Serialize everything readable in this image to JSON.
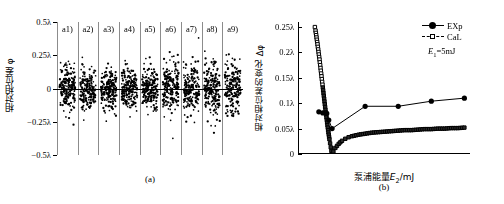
{
  "figure": {
    "panel_a_caption": "(a)",
    "panel_b_caption": "(b)"
  },
  "panel_a": {
    "ylabel": "相对相位差 φ",
    "yticks": [
      "0.5λ",
      "0.25λ",
      "0",
      "−0.25λ",
      "−0.5λ"
    ],
    "column_labels": [
      "a1)",
      "a2)",
      "a3)",
      "a4)",
      "a5)",
      "a6)",
      "a7)",
      "a8)",
      "a9)"
    ]
  },
  "panel_b": {
    "ylabel": "相对相位差的变化 Δφ",
    "xlabel": "泵浦能量E₂/mJ",
    "yticks": [
      "0.25λ",
      "0.2λ",
      "0.15λ",
      "0.1λ",
      "0.05λ",
      "0"
    ],
    "xticks": [
      "0",
      "5",
      "10",
      "15",
      "20",
      "25"
    ],
    "legend": [
      {
        "label": "EXp",
        "marker": "filled-circle",
        "line": "solid"
      },
      {
        "label": "CaL",
        "marker": "open-square",
        "line": "dashed"
      }
    ],
    "annotation": "E₁=5mJ"
  },
  "colors": {
    "ink": "#000000",
    "grid": "#9a9a9a",
    "background": "#ffffff"
  },
  "chart_data": [
    {
      "type": "scatter",
      "panel": "(a)",
      "title": "",
      "xlabel": "",
      "ylabel": "相对相位差 φ",
      "ylim": [
        -0.5,
        0.5
      ],
      "ytick_values": [
        0.5,
        0.25,
        0,
        -0.25,
        -0.5
      ],
      "ytick_labels": [
        "0.5λ",
        "0.25λ",
        "0",
        "−0.25λ",
        "−0.5λ"
      ],
      "grid": false,
      "units": "lambda",
      "groups": [
        {
          "name": "a1)",
          "n": 180,
          "center": 0.0,
          "spread": 0.085,
          "seed": 11
        },
        {
          "name": "a2)",
          "n": 180,
          "center": -0.005,
          "spread": 0.08,
          "seed": 23
        },
        {
          "name": "a3)",
          "n": 180,
          "center": -0.005,
          "spread": 0.082,
          "seed": 37
        },
        {
          "name": "a4)",
          "n": 180,
          "center": 0.0,
          "spread": 0.07,
          "seed": 41
        },
        {
          "name": "a5)",
          "n": 180,
          "center": -0.005,
          "spread": 0.072,
          "seed": 59
        },
        {
          "name": "a6)",
          "n": 180,
          "center": 0.0,
          "spread": 0.098,
          "seed": 67
        },
        {
          "name": "a7)",
          "n": 180,
          "center": 0.0,
          "spread": 0.092,
          "seed": 73
        },
        {
          "name": "a8)",
          "n": 180,
          "center": -0.005,
          "spread": 0.105,
          "seed": 89
        },
        {
          "name": "a9)",
          "n": 180,
          "center": 0.0,
          "spread": 0.1,
          "seed": 97
        }
      ]
    },
    {
      "type": "line",
      "panel": "(b)",
      "title": "",
      "xlabel": "泵浦能量E₂/mJ",
      "ylabel": "相对相位差的变化 Δφ",
      "xlim": [
        0,
        26
      ],
      "ylim": [
        0,
        0.26
      ],
      "xtick_values": [
        0,
        5,
        10,
        15,
        20,
        25
      ],
      "ytick_values": [
        0,
        0.05,
        0.1,
        0.15,
        0.2,
        0.25
      ],
      "ytick_labels": [
        "0",
        "0.05λ",
        "0.1λ",
        "0.15λ",
        "0.2λ",
        "0.25λ"
      ],
      "grid": false,
      "legend_position": "top-right",
      "annotation": "E₁=5mJ",
      "series": [
        {
          "name": "EXp",
          "marker": "filled-circle",
          "line": "solid",
          "x": [
            3.0,
            3.6,
            4.2,
            4.5,
            5.0,
            10.0,
            15.0,
            20.0,
            25.0
          ],
          "y": [
            0.083,
            0.081,
            0.08,
            0.067,
            0.05,
            0.094,
            0.094,
            0.104,
            0.11
          ]
        },
        {
          "name": "CaL",
          "marker": "open-square",
          "line": "dense-markers",
          "x": [
            2.4,
            2.5,
            2.6,
            2.7,
            2.8,
            2.9,
            3.0,
            3.1,
            3.2,
            3.3,
            3.4,
            3.5,
            3.6,
            3.7,
            3.8,
            3.9,
            4.0,
            4.1,
            4.2,
            4.3,
            4.4,
            4.5,
            4.6,
            4.7,
            4.8,
            4.9,
            5.0,
            5.2,
            5.5,
            6.0,
            6.5,
            7.0,
            7.5,
            8.0,
            9.0,
            10.0,
            11.0,
            12.0,
            13.0,
            14.0,
            15.0,
            16.0,
            17.0,
            18.0,
            19.0,
            20.0,
            21.0,
            22.0,
            23.0,
            24.0,
            25.0
          ],
          "y": [
            0.25,
            0.243,
            0.234,
            0.225,
            0.216,
            0.206,
            0.196,
            0.186,
            0.175,
            0.164,
            0.153,
            0.142,
            0.131,
            0.12,
            0.109,
            0.098,
            0.087,
            0.077,
            0.067,
            0.057,
            0.047,
            0.038,
            0.029,
            0.021,
            0.013,
            0.006,
            0.0,
            0.005,
            0.012,
            0.02,
            0.026,
            0.03,
            0.033,
            0.035,
            0.038,
            0.04,
            0.042,
            0.043,
            0.044,
            0.045,
            0.046,
            0.047,
            0.047,
            0.048,
            0.049,
            0.049,
            0.05,
            0.05,
            0.051,
            0.051,
            0.052
          ]
        }
      ]
    }
  ]
}
